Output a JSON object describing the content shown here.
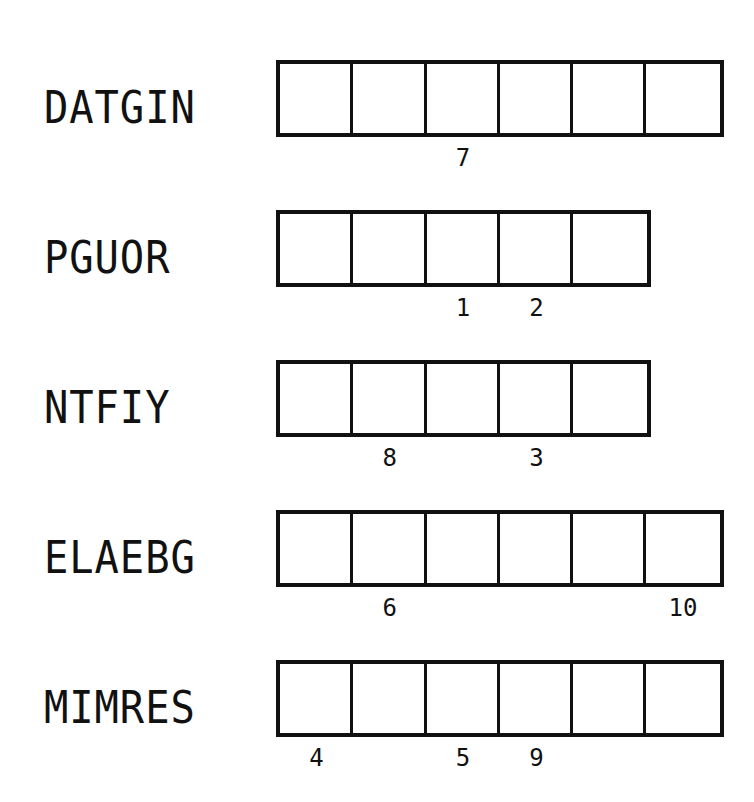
{
  "puzzle": {
    "type": "word-scramble",
    "rows": [
      {
        "scrambled": "DATGIN",
        "length": 6,
        "numbers": [
          {
            "cell": 2,
            "label": "7"
          }
        ]
      },
      {
        "scrambled": "PGUOR",
        "length": 5,
        "numbers": [
          {
            "cell": 2,
            "label": "1"
          },
          {
            "cell": 3,
            "label": "2"
          }
        ]
      },
      {
        "scrambled": "NTFIY",
        "length": 5,
        "numbers": [
          {
            "cell": 1,
            "label": "8"
          },
          {
            "cell": 3,
            "label": "3"
          }
        ]
      },
      {
        "scrambled": "ELAEBG",
        "length": 6,
        "numbers": [
          {
            "cell": 1,
            "label": "6"
          },
          {
            "cell": 5,
            "label": "10"
          }
        ]
      },
      {
        "scrambled": "MIMRES",
        "length": 6,
        "numbers": [
          {
            "cell": 0,
            "label": "4"
          },
          {
            "cell": 2,
            "label": "5"
          },
          {
            "cell": 3,
            "label": "9"
          }
        ]
      }
    ]
  }
}
